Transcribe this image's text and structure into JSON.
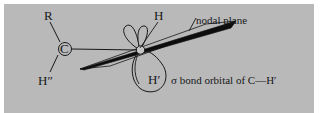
{
  "figure": {
    "kind": "chemistry-orbital-diagram",
    "panel_color": "#b9b9b9",
    "page_color": "#ffffff",
    "ink_color": "#17181a",
    "plane_fill": "#0d0d0d"
  },
  "labels": {
    "r_group": "R",
    "carbon": "C",
    "h_double_prime": "H″",
    "h_plain": "H",
    "h_prime": "H′",
    "nodal_plane": "nodal plane",
    "sigma_caption": "σ bond orbital of C—H′"
  },
  "parts": {
    "upper_lobe_left": "orbital-lobe-upper-left",
    "upper_lobe_right": "orbital-lobe-upper-right",
    "lower_lobe": "orbital-lobe-lower",
    "nodal_plane_shape": "nodal-plane-parallelogram",
    "center_atom": "central-carbon-node",
    "left_atom": "left-carbon-node",
    "bond_c_to_r": "bond-c-r",
    "bond_c_to_hdd": "bond-c-hdouble-prime",
    "bond_c_to_center": "bond-c-center",
    "leader_h": "leader-line-h",
    "leader_nodal": "leader-line-nodal-plane"
  }
}
